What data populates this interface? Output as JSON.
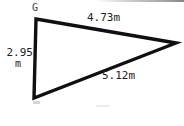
{
  "figure": {
    "kind": "geometry-triangle-diagram",
    "background_color": "#ffffff",
    "stroke_color": "#101014",
    "stroke_width_px": 3,
    "text_color": "#222226",
    "unit": "m",
    "vertices": {
      "top_left": {
        "label": "G",
        "x": 36,
        "y": 19
      },
      "bottom_left": {
        "label": "",
        "x": 34,
        "y": 98
      },
      "right": {
        "label": "",
        "x": 176,
        "y": 43
      }
    },
    "sides": [
      {
        "name": "top-side",
        "from": "G",
        "to": "right",
        "length_text": "4.73m",
        "length": 4.73
      },
      {
        "name": "bottom-side",
        "from": "bottom_left",
        "to": "right",
        "length_text": "5.12m",
        "length": 5.12
      },
      {
        "name": "left-side",
        "from": "G",
        "to": "bottom_left",
        "length_text": "2.95",
        "unit_text": "m",
        "length": 2.95
      }
    ]
  },
  "labels": {
    "vertex_g": "G",
    "top_side": "4.73m",
    "bottom_side": "5.12m",
    "left_side_value": "2.95",
    "left_side_unit": "m"
  }
}
